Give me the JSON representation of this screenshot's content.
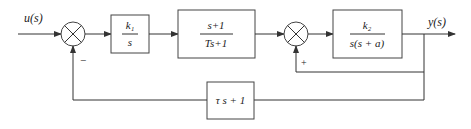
{
  "diagram": {
    "type": "control-block-diagram",
    "signals": {
      "input": "u(s)",
      "output": "y(s)"
    },
    "blocks": [
      {
        "id": "integrator",
        "num": "k₁",
        "den": "s"
      },
      {
        "id": "lead-lag",
        "num": "s+1",
        "den": "Ts+1"
      },
      {
        "id": "plant",
        "num": "k₂",
        "den": "s(s + a)"
      },
      {
        "id": "feedback",
        "expr": "τ s + 1"
      }
    ],
    "summing_junctions": [
      {
        "id": "sum1",
        "feedback_sign": "−"
      },
      {
        "id": "sum2",
        "feedback_sign": "+"
      }
    ]
  }
}
